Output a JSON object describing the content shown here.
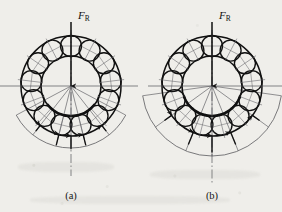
{
  "figure": {
    "background_color": "#efeeea",
    "ink_color": "#1a1a1a",
    "thin_line_color": "#55555a",
    "panels": [
      {
        "id": "a",
        "caption": "(a)",
        "load_label": "F_R",
        "load_label_base": "F",
        "load_label_sub": "R",
        "center": {
          "x": 71,
          "y": 86
        },
        "outer_race_radius": 50,
        "inner_race_radius": 30,
        "pitch_radius": 40,
        "ball_count": 13,
        "ball_radius": 10.5,
        "ball_start_angle_deg": 90,
        "envelope_arc_radius": 62,
        "load_zone_half_angle_deg": 62,
        "load_arrow_count": 5,
        "load_arrow_angles_deg": [
          232,
          256,
          270,
          284,
          308
        ],
        "load_arrow_lengths": [
          13,
          20,
          24,
          20,
          13
        ],
        "fan_ray_count": 5,
        "fan_ray_angles_deg": [
          232,
          256,
          270,
          284,
          308
        ],
        "vertical_axis": {
          "top": 14,
          "bottom": 176
        },
        "horizontal_axis": {
          "left": 0,
          "right": 138
        },
        "load_arrow_head_size": 4
      },
      {
        "id": "b",
        "caption": "(b)",
        "load_label": "F_R",
        "load_label_base": "F",
        "load_label_sub": "R",
        "center": {
          "x": 212,
          "y": 86
        },
        "outer_race_radius": 50,
        "inner_race_radius": 30,
        "pitch_radius": 40,
        "ball_count": 13,
        "ball_radius": 10.5,
        "ball_start_angle_deg": 90,
        "envelope_arc_radius": 70,
        "load_zone_half_angle_deg": 82,
        "load_arrow_count": 5,
        "load_arrow_angles_deg": [
          216,
          248,
          270,
          292,
          324
        ],
        "load_arrow_lengths": [
          16,
          24,
          30,
          24,
          16
        ],
        "fan_ray_count": 5,
        "fan_ray_angles_deg": [
          216,
          248,
          270,
          292,
          324
        ],
        "vertical_axis": {
          "top": 14,
          "bottom": 184
        },
        "horizontal_axis": {
          "left": 148,
          "right": 282
        },
        "load_arrow_head_size": 4
      }
    ],
    "caption_y": 196,
    "load_label_y": 17
  }
}
